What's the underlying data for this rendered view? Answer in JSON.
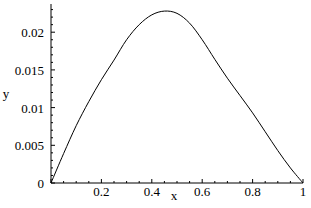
{
  "chart_data": {
    "type": "line",
    "title": "",
    "xlabel": "x",
    "ylabel": "y",
    "xlim": [
      0,
      1
    ],
    "ylim": [
      0,
      0.023
    ],
    "grid": false,
    "legend": null,
    "x_ticks": [
      {
        "value": 0.2,
        "label": "0.2"
      },
      {
        "value": 0.4,
        "label": "0.4"
      },
      {
        "value": 0.6,
        "label": "0.6"
      },
      {
        "value": 0.8,
        "label": "0.8"
      },
      {
        "value": 1,
        "label": "1"
      }
    ],
    "y_ticks": [
      {
        "value": 0,
        "label": "0"
      },
      {
        "value": 0.005,
        "label": "0.005"
      },
      {
        "value": 0.01,
        "label": "0.01"
      },
      {
        "value": 0.015,
        "label": "0.015"
      },
      {
        "value": 0.02,
        "label": "0.02"
      }
    ],
    "series": [
      {
        "name": "y(x)",
        "color": "#000000",
        "x": [
          0,
          0.05,
          0.1,
          0.15,
          0.2,
          0.25,
          0.3,
          0.35,
          0.4,
          0.45,
          0.5,
          0.55,
          0.6,
          0.65,
          0.7,
          0.75,
          0.8,
          0.85,
          0.9,
          0.95,
          1.0
        ],
        "values": [
          0,
          0.0039,
          0.0076,
          0.0108,
          0.0137,
          0.0163,
          0.019,
          0.021,
          0.0223,
          0.0228,
          0.0225,
          0.0212,
          0.019,
          0.0164,
          0.0139,
          0.0116,
          0.0093,
          0.0068,
          0.0043,
          0.002,
          0
        ]
      }
    ]
  }
}
